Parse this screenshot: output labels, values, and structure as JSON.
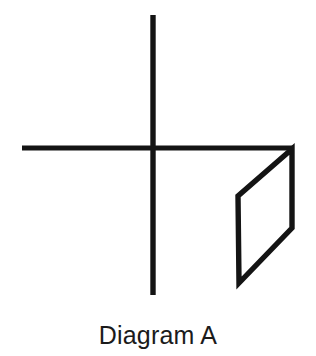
{
  "figure": {
    "caption": "Diagram A",
    "background_color": "#ffffff",
    "ink_color": "#141414",
    "stroke_width": 5,
    "elements": {
      "vertical_axis": {
        "name": "vertical-line",
        "x1": 153,
        "y1": 15,
        "x2": 153,
        "y2": 295
      },
      "horizontal_axis": {
        "name": "horizontal-line",
        "x1": 22,
        "y1": 148,
        "x2": 294,
        "y2": 148
      },
      "parallelogram": {
        "name": "parallelogram",
        "points": "292,149 238,196 239,283 292,228",
        "vertices": [
          {
            "label": "top-right",
            "x": 292,
            "y": 149
          },
          {
            "label": "upper-left",
            "x": 238,
            "y": 196
          },
          {
            "label": "lower-left",
            "x": 239,
            "y": 283
          },
          {
            "label": "right-middle",
            "x": 292,
            "y": 228
          }
        ]
      }
    }
  }
}
